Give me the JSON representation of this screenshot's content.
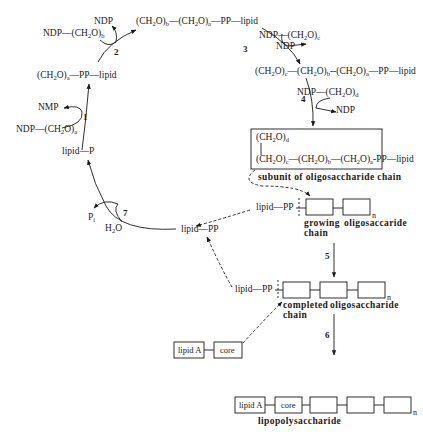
{
  "diagram": {
    "steps": [
      {
        "number": "1",
        "in": "NDP—(CH2)a",
        "out": "NMP"
      },
      {
        "number": "2",
        "in": "NDP—(CH2O)b",
        "out": "NDP"
      },
      {
        "number": "3",
        "in": "NDP—(CH2O)c",
        "out": "NDP"
      },
      {
        "number": "4",
        "in": "NDP—(CH2O)d",
        "out": "NDP"
      },
      {
        "number": "5"
      },
      {
        "number": "6"
      },
      {
        "number": "7",
        "in": "H2O",
        "out": "Pi"
      }
    ],
    "labels": {
      "lipid_p": "lipid—P",
      "lipid_pp": "lipid—PP",
      "lipid_pp_growing": "lipid—PP",
      "lipid_pp_completed": "lipid—PP",
      "subunit_caption": "subunit of oligosaccharide chain",
      "growing_1": "growing",
      "growing_2": "chain",
      "growing_3": "oligosaccaride",
      "completed_1": "completed",
      "completed_2": "chain",
      "completed_3": "oligosaccharide",
      "lipid_a": "lipid A",
      "core": "core",
      "lipid_a_2": "lipid A",
      "core_2": "core",
      "lps_caption": "lipopolysaccharide",
      "n": "n",
      "ndp": "NDP",
      "nmp": "NMP",
      "pp": "PP",
      "lipid": "lipid"
    }
  }
}
